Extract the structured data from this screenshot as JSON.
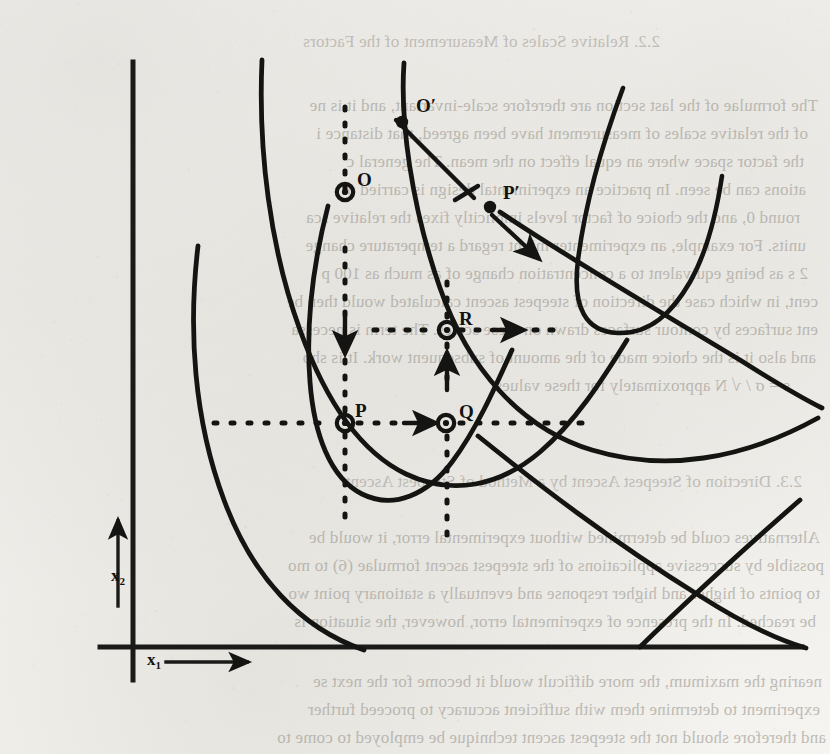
{
  "page": {
    "width": 830,
    "height": 754,
    "background_color": "#f6f5f2",
    "ink_color": "#141412",
    "bleed_text_color": "#9d9a93"
  },
  "bleed_through_text": {
    "note": "faint mirrored show-through text from the reverse side of the scanned page",
    "top_block": [
      {
        "text": "2.2.  Relative Scales of Measurement of the Factors",
        "x": 170,
        "y": 32,
        "size": 17
      },
      {
        "text": "The formulae of the last section are therefore scale-invariant, and it is ne",
        "x": 12,
        "y": 96,
        "size": 17
      },
      {
        "text": "of the relative scales of measurement have been agreed, that distance i",
        "x": 22,
        "y": 124,
        "size": 17
      },
      {
        "text": "the factor space where an equal effect on the mean. The general c",
        "x": 26,
        "y": 152,
        "size": 17
      },
      {
        "text": "ations can be seen. In practice an experimental design is carried o",
        "x": 24,
        "y": 180,
        "size": 17
      },
      {
        "text": "round 0, and the choice of factor levels implicitly fixes the relative sca",
        "x": 30,
        "y": 208,
        "size": 17
      },
      {
        "text": "units.  For example, an experimenter might regard a temperature change",
        "x": 24,
        "y": 236,
        "size": 17
      },
      {
        "text": "2 s as  being equivalent to a concentration change of as much as 100 p",
        "x": 22,
        "y": 264,
        "size": 17
      },
      {
        "text": "cent, in which case the direction of steepest ascent calculated would then be",
        "x": 12,
        "y": 292,
        "size": 17
      },
      {
        "text": "ent surfaces by contour surfaces drawn on these scales. The term is necessa",
        "x": 12,
        "y": 320,
        "size": 17
      },
      {
        "text": "and also it is the choice made of the amount of subsequent work. It is sho",
        "x": 14,
        "y": 348,
        "size": 17
      },
      {
        "text": "s =  σ / √ N  approximately for these values",
        "x": 40,
        "y": 376,
        "size": 17
      }
    ],
    "mid_block": [
      {
        "text": "2.3.  Direction of Steepest Ascent by a Method of Steepest Ascent",
        "x": 28,
        "y": 472,
        "size": 17
      },
      {
        "text": "Alternatives could be determined without experimental error, it would be",
        "x": 10,
        "y": 528,
        "size": 17
      },
      {
        "text": "possible by successive applications of the steepest ascent formulae (6) to mo",
        "x": 6,
        "y": 556,
        "size": 17
      },
      {
        "text": "to points of higher and higher response and eventually a stationary point wo",
        "x": 10,
        "y": 584,
        "size": 17
      },
      {
        "text": "be reached. In the presence of experimental error, however, the situation is",
        "x": 14,
        "y": 612,
        "size": 17
      }
    ],
    "bottom_block": [
      {
        "text": "nearing the maximum, the more difficult would it become for the next se",
        "x": 8,
        "y": 672,
        "size": 17
      },
      {
        "text": "experiment to determine them with sufficient accuracy to proceed further",
        "x": 10,
        "y": 700,
        "size": 17
      },
      {
        "text": "and therefore should not the steepest ascent technique be employed to come to",
        "x": 4,
        "y": 728,
        "size": 17
      }
    ]
  },
  "figure": {
    "name": "steepest-ascent-contour-diagram",
    "axes": {
      "x_axis": {
        "label": "x",
        "subscript": "1",
        "label_x": 147,
        "label_y": 658,
        "arrow_from_x": 166,
        "arrow_to_x": 252,
        "arrow_y": 662
      },
      "y_axis": {
        "label": "x",
        "subscript": "2",
        "label_x": 111,
        "label_y": 575,
        "arrow_from_y": 606,
        "arrow_to_y": 516,
        "arrow_x": 118
      },
      "vertical_axis_x": 133,
      "vertical_axis_top": 62,
      "vertical_axis_bottom": 680,
      "horizontal_axis_y": 647,
      "horizontal_axis_left": 100,
      "horizontal_axis_right": 802
    },
    "points": [
      {
        "id": "O",
        "label": "O",
        "x": 345,
        "y": 192,
        "marker": "ring",
        "label_dx": 12,
        "label_dy": -22
      },
      {
        "id": "Op",
        "label": "O′",
        "x": 402,
        "y": 122,
        "marker": "dot",
        "label_dx": 14,
        "label_dy": -26
      },
      {
        "id": "Pp",
        "label": "P′",
        "x": 490,
        "y": 207,
        "marker": "dot",
        "label_dx": 13,
        "label_dy": -24
      },
      {
        "id": "R",
        "label": "R",
        "x": 447,
        "y": 330,
        "marker": "ring",
        "label_dx": 12,
        "label_dy": -21
      },
      {
        "id": "P",
        "label": "P",
        "x": 345,
        "y": 423,
        "marker": "ring",
        "label_dx": 10,
        "label_dy": -22
      },
      {
        "id": "Q",
        "label": "Q",
        "x": 446,
        "y": 423,
        "marker": "ring",
        "label_dx": 13,
        "label_dy": -21
      }
    ],
    "contours": {
      "count": 4,
      "shape": "nested open parabolic ridge contours opening to the lower-right",
      "description": "elongated U / parabolic response-surface contour lines of increasing value toward the inner curve"
    },
    "annotations": [
      {
        "name": "oo-prime-gradient-line",
        "type": "solid-line-with-cross",
        "desc": "solid path from O through O' crossing a second solid line"
      },
      {
        "name": "p-prime-arrow",
        "type": "solid-arrow",
        "desc": "short arrow from P' pointing down-right (steepest ascent direction at P')"
      },
      {
        "name": "p-to-q-dashed-arrow",
        "type": "dashed-arrow",
        "desc": "horizontal dashed path with arrowhead from P toward Q"
      },
      {
        "name": "r-horizontal-dashed-arrow",
        "type": "dashed-arrow",
        "desc": "horizontal dashed path with arrowhead through R"
      },
      {
        "name": "o-vertical-dashed",
        "type": "dashed-line",
        "desc": "vertical dashed line through O and P"
      },
      {
        "name": "q-vertical-dashed",
        "type": "dashed-line",
        "desc": "vertical dashed line through R and Q with upward arrowhead"
      }
    ]
  }
}
